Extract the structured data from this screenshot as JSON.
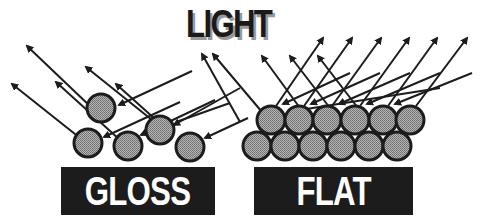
{
  "diagram": {
    "title": "LIGHT",
    "labels": {
      "gloss": "GLOSS",
      "flat": "FLAT"
    },
    "colors": {
      "ink": "#1c1c1c",
      "particle_fill": "#9a9a9a",
      "shadow": "#9a9a9a",
      "label_text": "#ffffff",
      "background": "#ffffff"
    },
    "panels": [
      {
        "name": "gloss",
        "description": "Scattered spherical particles reflect light rays in a uniform direction (specular reflection)",
        "particles": [
          {
            "cx": 101,
            "cy": 108
          },
          {
            "cx": 88,
            "cy": 143
          },
          {
            "cx": 128,
            "cy": 146
          },
          {
            "cx": 160,
            "cy": 130
          },
          {
            "cx": 190,
            "cy": 147
          }
        ]
      },
      {
        "name": "flat",
        "description": "Densely packed particles scatter light rays in many directions (diffuse reflection)",
        "particles_rows": 2,
        "particles_per_row": 6
      }
    ]
  }
}
